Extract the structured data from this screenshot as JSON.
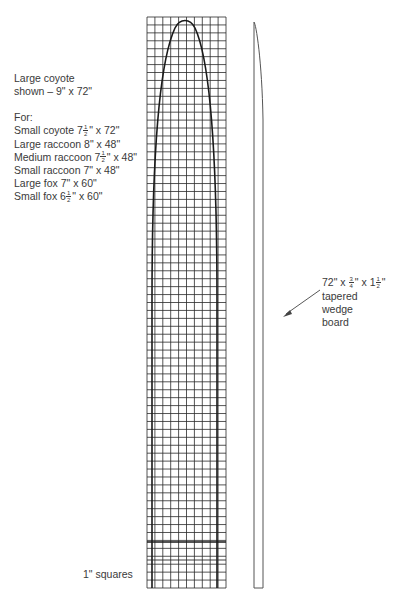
{
  "figure": {
    "stretcher_label": {
      "title_line1": "Large coyote",
      "title_line2": "shown – 9\" x 72\"",
      "for_heading": "For:",
      "sizes": [
        {
          "animal": "Small coyote",
          "whole": "7",
          "num": "1",
          "den": "2",
          "rest": "\" x 72\""
        },
        {
          "animal": "Large raccoon",
          "whole": "8\" x 48\"",
          "num": "",
          "den": "",
          "rest": ""
        },
        {
          "animal": "Medium raccoon",
          "whole": "7",
          "num": "1",
          "den": "2",
          "rest": "\" x 48\""
        },
        {
          "animal": "Small raccoon",
          "whole": "7\" x 48\"",
          "num": "",
          "den": "",
          "rest": ""
        },
        {
          "animal": "Large fox",
          "whole": "7\" x 60\"",
          "num": "",
          "den": "",
          "rest": ""
        },
        {
          "animal": "Small fox",
          "whole": "6",
          "num": "1",
          "den": "2",
          "rest": "\" x 60\""
        }
      ]
    },
    "board_label": {
      "dim_prefix": "72\" x ",
      "thick_num": "3",
      "thick_den": "4",
      "dim_mid": "\" x 1",
      "width_num": "1",
      "width_den": "2",
      "dim_suffix": "\"",
      "line2": "tapered",
      "line3": "wedge",
      "line4": "board"
    },
    "grid_label": "1\" squares",
    "grid": {
      "columns": 10,
      "rows": 72,
      "square_unit": "1 inch"
    },
    "colors": {
      "grid_line": "#2a2a2a",
      "outline": "#1a1a1a",
      "text": "#3a3a3a",
      "board": "#555555"
    }
  }
}
